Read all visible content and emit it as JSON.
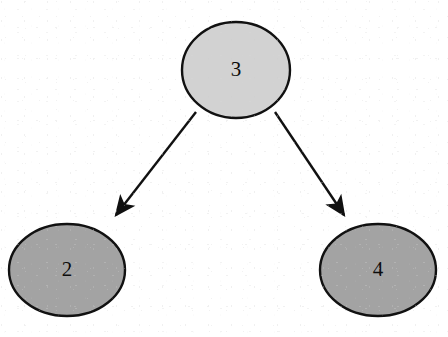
{
  "diagram": {
    "type": "binary-tree",
    "background_color": "#ffffff",
    "outline_color": "#111111",
    "outline_width": 2,
    "label_color": "#0d0d0d",
    "nodes": [
      {
        "id": "root",
        "label": "3",
        "role": "root",
        "fill": "#d2d2d2",
        "cx": 236,
        "cy": 70,
        "rx": 54,
        "ry": 48
      },
      {
        "id": "left-child",
        "label": "2",
        "role": "left-child",
        "fill": "#a3a3a3",
        "cx": 67,
        "cy": 270,
        "rx": 58,
        "ry": 46
      },
      {
        "id": "right-child",
        "label": "4",
        "role": "right-child",
        "fill": "#a3a3a3",
        "cx": 378,
        "cy": 270,
        "rx": 58,
        "ry": 46
      }
    ],
    "edges": [
      {
        "id": "edge-root-to-left",
        "from": "root",
        "to": "left-child",
        "direction": "down-left",
        "arrowhead": "filled-triangle",
        "x1": 196,
        "y1": 112,
        "x2": 116,
        "y2": 215
      },
      {
        "id": "edge-root-to-right",
        "from": "root",
        "to": "right-child",
        "direction": "down-right",
        "arrowhead": "filled-triangle",
        "x1": 275,
        "y1": 112,
        "x2": 344,
        "y2": 215
      }
    ]
  }
}
